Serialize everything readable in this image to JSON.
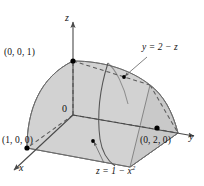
{
  "figure": {
    "kind": "3d-solid-region",
    "background_color": "#ffffff",
    "surface_fill": "#d2d2d2",
    "edge_color": "#6b6b6b",
    "axis_color": "#4a4a4a"
  },
  "axes": {
    "z_label": "z",
    "x_label": "x",
    "y_label": "y",
    "origin_label": "0"
  },
  "points": [
    {
      "name": "z-intercept",
      "label": "(0, 0, 1)"
    },
    {
      "name": "x-intercept",
      "label": "(1, 0, 0)"
    },
    {
      "name": "y-intercept",
      "label": "(0, 2, 0)"
    }
  ],
  "equations": [
    {
      "name": "plane",
      "label": "y = 2 − z",
      "base": "y = 2 − z",
      "exponent": ""
    },
    {
      "name": "parabolic-cylinder",
      "label": "z = 1 − x²",
      "base": "z = 1 − x",
      "exponent": "2"
    }
  ],
  "labels": {
    "point_z": "(0, 0, 1)",
    "point_x": "(1, 0, 0)",
    "point_y": "(0, 2, 0)",
    "eq_plane": "y = 2 − z",
    "eq_cylinder_base": "z = 1 − x",
    "eq_cylinder_exp": "2",
    "axis_z": "z",
    "axis_x": "x",
    "axis_y": "y",
    "origin": "0"
  }
}
